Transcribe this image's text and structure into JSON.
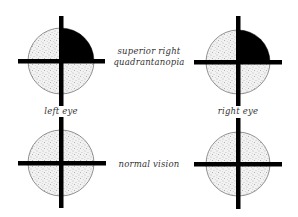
{
  "diagram": {
    "type": "visual-field-diagram",
    "colors": {
      "background": "#ffffff",
      "stipple_fill": "#f2f2f2",
      "stipple_dot": "#7a7a7a",
      "defect_fill": "#000000",
      "cross": "#000000",
      "circle_outline": "#777777",
      "text": "#333333"
    },
    "labels": {
      "condition_top": [
        "superior right",
        "quadrantanopia"
      ],
      "condition_bottom": "normal vision",
      "left_eye": "left eye",
      "right_eye": "right eye"
    },
    "fields": [
      {
        "id": "top-left",
        "eye": "left eye",
        "row": "superior right quadrantanopia",
        "cx": 61,
        "cy": 61,
        "r": 33,
        "defect_quadrant": "superior-right"
      },
      {
        "id": "top-right",
        "eye": "right eye",
        "row": "superior right quadrantanopia",
        "cx": 238,
        "cy": 62,
        "r": 32,
        "defect_quadrant": "superior-right"
      },
      {
        "id": "bottom-left",
        "eye": "left eye",
        "row": "normal vision",
        "cx": 61,
        "cy": 163,
        "r": 33,
        "defect_quadrant": null
      },
      {
        "id": "bottom-right",
        "eye": "right eye",
        "row": "normal vision",
        "cx": 238,
        "cy": 164,
        "r": 32,
        "defect_quadrant": null
      }
    ]
  }
}
